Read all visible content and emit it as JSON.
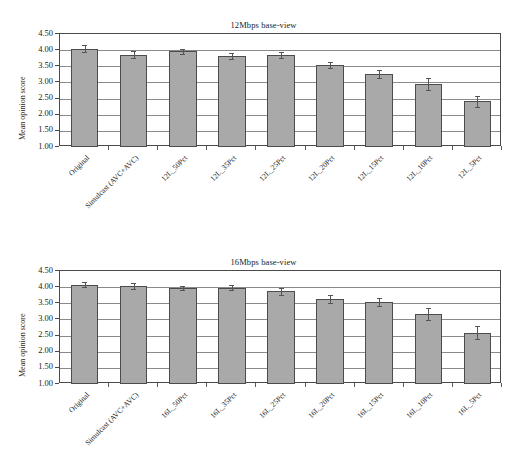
{
  "figure": {
    "ylabel": "Mean opinion score",
    "y_ticks": [
      "1.00",
      "1.50",
      "2.00",
      "2.50",
      "3.00",
      "3.50",
      "4.00",
      "4.50"
    ]
  },
  "chart_data": [
    {
      "type": "bar",
      "title": "12Mbps base-view",
      "xlabel": "",
      "ylabel": "Mean opinion score",
      "ylim": [
        1.0,
        4.5
      ],
      "ytick_values": [
        1.0,
        1.5,
        2.0,
        2.5,
        3.0,
        3.5,
        4.0,
        4.5
      ],
      "grid": true,
      "legend": "none",
      "categories": [
        "Original",
        "Simulcast (AVC+AVC)",
        "12L_50Pct",
        "12L_35Pct",
        "12L_25Pct",
        "12L_20Pct",
        "12L_15Pct",
        "12L_10Pct",
        "12L_5Pct"
      ],
      "values": [
        4.05,
        3.86,
        3.96,
        3.83,
        3.85,
        3.54,
        3.27,
        2.96,
        2.41
      ],
      "errors": [
        0.1,
        0.1,
        0.07,
        0.09,
        0.09,
        0.09,
        0.13,
        0.18,
        0.18
      ]
    },
    {
      "type": "bar",
      "title": "16Mbps base-view",
      "xlabel": "",
      "ylabel": "Mean opinion score",
      "ylim": [
        1.0,
        4.5
      ],
      "ytick_values": [
        1.0,
        1.5,
        2.0,
        2.5,
        3.0,
        3.5,
        4.0,
        4.5
      ],
      "grid": true,
      "legend": "none",
      "categories": [
        "Original",
        "Simulcast (AVC+AVC)",
        "16L_50Pct",
        "16L_35Pct",
        "16L_25Pct",
        "16L_20Pct",
        "16L_15Pct",
        "16L_10Pct",
        "16L_5Pct"
      ],
      "values": [
        4.08,
        4.04,
        3.98,
        3.98,
        3.87,
        3.63,
        3.53,
        3.16,
        2.59
      ],
      "errors": [
        0.08,
        0.1,
        0.07,
        0.08,
        0.1,
        0.12,
        0.12,
        0.18,
        0.21
      ]
    }
  ],
  "colors": {
    "bar_fill": "#a9a9a9",
    "bar_stroke": "#4c4c4c",
    "grid": "#8a8a8a",
    "axis": "#4a4a4a",
    "error": "#555555",
    "text": "#1c1c1c"
  }
}
